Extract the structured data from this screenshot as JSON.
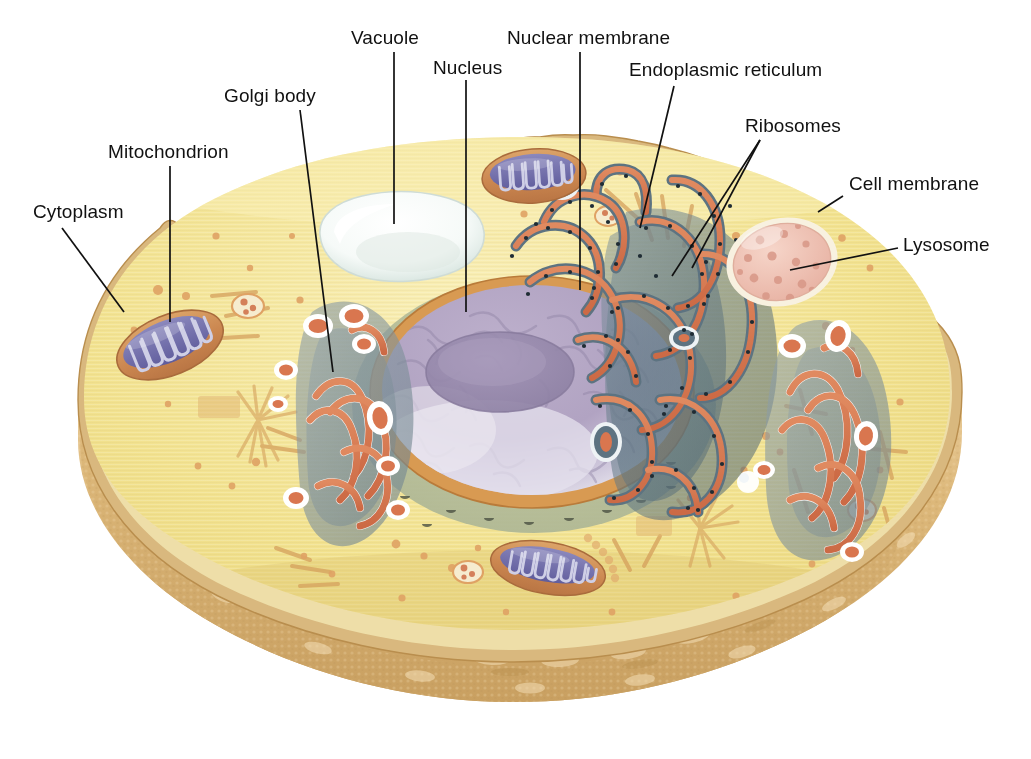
{
  "figure": {
    "kind": "labeled-biological-illustration"
  },
  "labels": {
    "cytoplasm": "Cytoplasm",
    "mitochondrion": "Mitochondrion",
    "golgi_body": "Golgi body",
    "vacuole": "Vacuole",
    "nucleus": "Nucleus",
    "nuclear_membrane": "Nuclear membrane",
    "endoplasmic_reticulum": "Endoplasmic reticulum",
    "ribosomes": "Ribosomes",
    "cell_membrane": "Cell membrane",
    "lysosome": "Lysosome"
  },
  "colors": {
    "background": "#ffffff",
    "label_text": "#111111",
    "leader_line": "#111111",
    "cytoplasm": "#f2e08e",
    "cytoplasm_light": "#f7ecab",
    "cell_membrane_rim": "#ddbf80",
    "cell_membrane_edge": "#c79a54",
    "outer_wall": "#dcb678",
    "outer_wall_dark": "#c9a061",
    "outer_wall_light": "#ecd4a4",
    "nucleus_fill": "#b3a6c4",
    "nucleus_light": "#d9d3e4",
    "nucleolus": "#9c8fb0",
    "nuclear_membrane": "#d89a52",
    "nuclear_region": "#b9bf9a",
    "er_membrane": "#5e7482",
    "er_lumen": "#d9764f",
    "er_highlight": "#eef2f4",
    "ribosome_dot": "#223038",
    "golgi_lumen": "#d9764f",
    "golgi_shadow": "#7d8f98",
    "mitochondrion_outer": "#cf8b52",
    "mitochondrion_inner": "#6e6ba8",
    "mitochondrion_cristae": "#4e4b87",
    "lysosome_fill": "#eec0b4",
    "lysosome_speck": "#dd9c8c",
    "vacuole_fill": "#fbfdfc",
    "vacuole_shade": "#d6e2dd",
    "vesicle": "#e0a164",
    "filament": "#d9a765"
  },
  "structures": [
    {
      "name": "Cell membrane",
      "description": "wavy tan outer boundary of the cell"
    },
    {
      "name": "Cytoplasm",
      "description": "pale yellow interior ground substance"
    },
    {
      "name": "Nucleus",
      "description": "large lavender oval with nucleolus"
    },
    {
      "name": "Nuclear membrane",
      "description": "orange envelope around the nucleus"
    },
    {
      "name": "Nucleolus",
      "description": "darker purple disc inside the nucleus"
    },
    {
      "name": "Endoplasmic reticulum",
      "description": "folded slate-blue membranes with orange lumen, right of nucleus"
    },
    {
      "name": "Ribosomes",
      "description": "dark dots studding the endoplasmic reticulum"
    },
    {
      "name": "Golgi body",
      "description": "stacked flattened sacs left of the nucleus"
    },
    {
      "name": "Mitochondrion",
      "description": "oval organelle with blue inner cristae"
    },
    {
      "name": "Vacuole",
      "description": "white irregular sac in upper cytoplasm"
    },
    {
      "name": "Lysosome",
      "description": "pale pink speckled oval at upper right"
    }
  ],
  "leaders": [
    {
      "label": "cytoplasm",
      "x1": 62,
      "y1": 228,
      "x2": 124,
      "y2": 312
    },
    {
      "label": "mitochondrion",
      "x1": 170,
      "y1": 166,
      "x2": 170,
      "y2": 320
    },
    {
      "label": "golgi_body",
      "x1": 300,
      "y1": 110,
      "x2": 332,
      "y2": 370
    },
    {
      "label": "vacuole",
      "x1": 394,
      "y1": 52,
      "x2": 394,
      "y2": 222
    },
    {
      "label": "nucleus",
      "x1": 466,
      "y1": 80,
      "x2": 466,
      "y2": 310
    },
    {
      "label": "nuclear_membrane",
      "x1": 580,
      "y1": 52,
      "x2": 580,
      "y2": 288
    },
    {
      "label": "endoplasmic_reticulum",
      "x1": 672,
      "y1": 86,
      "x2": 640,
      "y2": 228
    },
    {
      "label": "ribosomes_a",
      "x1": 760,
      "y1": 140,
      "x2": 676,
      "y2": 272
    },
    {
      "label": "ribosomes_b",
      "x1": 760,
      "y1": 140,
      "x2": 692,
      "y2": 268
    },
    {
      "label": "cell_membrane",
      "x1": 840,
      "y1": 196,
      "x2": 818,
      "y2": 212
    },
    {
      "label": "lysosome",
      "x1": 898,
      "y1": 248,
      "x2": 792,
      "y2": 268
    }
  ],
  "label_positions": {
    "cytoplasm": {
      "x": 33,
      "y": 202
    },
    "mitochondrion": {
      "x": 108,
      "y": 142
    },
    "golgi_body": {
      "x": 224,
      "y": 86
    },
    "vacuole": {
      "x": 351,
      "y": 28
    },
    "nucleus": {
      "x": 433,
      "y": 58
    },
    "nuclear_membrane": {
      "x": 507,
      "y": 28
    },
    "endoplasmic_reticulum": {
      "x": 629,
      "y": 60
    },
    "ribosomes": {
      "x": 745,
      "y": 116
    },
    "cell_membrane": {
      "x": 849,
      "y": 174
    },
    "lysosome": {
      "x": 903,
      "y": 235
    }
  }
}
